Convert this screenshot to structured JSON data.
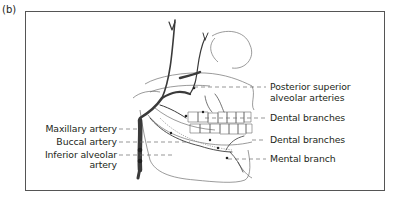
{
  "figure": {
    "panel_label": "(b)",
    "colors": {
      "frame": "#555555",
      "artery": "#3a3a3a",
      "bone_outline": "#6a6a6a",
      "text": "#231f20",
      "leader": "#6a6a6a"
    }
  },
  "labels": {
    "left": [
      {
        "id": "maxillary",
        "text": "Maxillary artery"
      },
      {
        "id": "buccal",
        "text": "Buccal artery"
      },
      {
        "id": "inferior_alveolar_1",
        "text": "Inferior alveolar"
      },
      {
        "id": "inferior_alveolar_2",
        "text": "artery"
      }
    ],
    "right": [
      {
        "id": "psa_1",
        "text": "Posterior superior"
      },
      {
        "id": "psa_2",
        "text": "alveolar arteries"
      },
      {
        "id": "dental_upper",
        "text": "Dental branches"
      },
      {
        "id": "dental_lower",
        "text": "Dental branches"
      },
      {
        "id": "mental",
        "text": "Mental branch"
      }
    ]
  }
}
